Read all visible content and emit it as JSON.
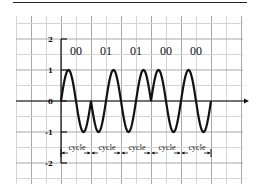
{
  "diagram": {
    "title": "",
    "type": "phase-modulated waveform",
    "y_ticks": [
      "2",
      "1",
      "0",
      "-1",
      "-2"
    ],
    "bit_labels": [
      "00",
      "01",
      "01",
      "00",
      "00"
    ],
    "cycle_labels": [
      "cycle",
      "cycle",
      "cycle",
      "cycle",
      "cycle"
    ],
    "colors": {
      "wave": "#111111",
      "grid": "#c8c8c8",
      "axis": "#111111"
    }
  },
  "chart_data": {
    "type": "line",
    "title": "",
    "xlabel": "",
    "ylabel": "",
    "ylim": [
      -2,
      2
    ],
    "y_ticks": [
      2,
      1,
      0,
      -1,
      -2
    ],
    "grid": true,
    "series": [
      {
        "name": "signal",
        "segments": [
          {
            "bits": "00",
            "phase": "sin",
            "amplitude": 1
          },
          {
            "bits": "01",
            "phase": "-sin",
            "amplitude": 1
          },
          {
            "bits": "01",
            "phase": "-sin",
            "amplitude": 1
          },
          {
            "bits": "00",
            "phase": "sin",
            "amplitude": 1
          },
          {
            "bits": "00",
            "phase": "sin",
            "amplitude": 1
          }
        ]
      }
    ],
    "annotations": [
      "00",
      "01",
      "01",
      "00",
      "00",
      "cycle",
      "cycle",
      "cycle",
      "cycle",
      "cycle"
    ]
  }
}
